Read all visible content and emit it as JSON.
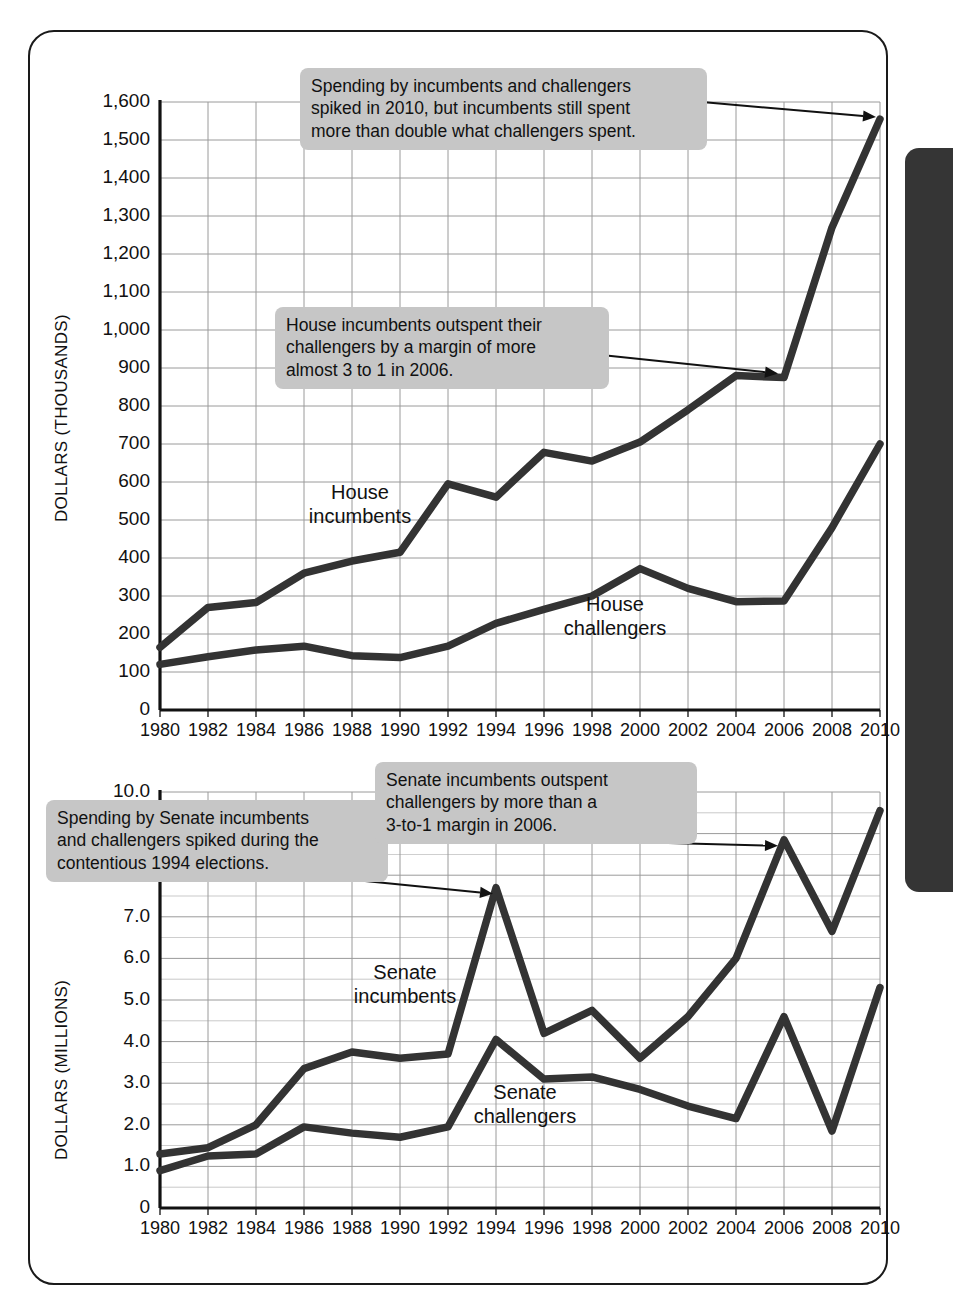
{
  "page": {
    "side_tab_color": "#353535",
    "card_border_color": "#1a1a1a",
    "callout_bg": "#c6c6c6",
    "line_color": "#333333",
    "grid_color": "#9a9a9a"
  },
  "chart_data": [
    {
      "id": "house",
      "type": "line",
      "title": "",
      "xlabel": "",
      "ylabel": "DOLLARS (THOUSANDS)",
      "x": [
        1980,
        1982,
        1984,
        1986,
        1988,
        1990,
        1992,
        1994,
        1996,
        1998,
        2000,
        2002,
        2004,
        2006,
        2008,
        2010
      ],
      "xtick_labels": [
        "1980",
        "1982",
        "1984",
        "1986",
        "1988",
        "1990",
        "1992",
        "1994",
        "1996",
        "1998",
        "2000",
        "2002",
        "2004",
        "2006",
        "2008",
        "2010"
      ],
      "ytick_labels": [
        "0",
        "100",
        "200",
        "300",
        "400",
        "500",
        "600",
        "700",
        "800",
        "900",
        "1,000",
        "1,100",
        "1,200",
        "1,300",
        "1,400",
        "1,500",
        "1,600"
      ],
      "ylim": [
        0,
        1600
      ],
      "xlim": [
        1980,
        2010
      ],
      "grid": true,
      "legend": "inline-labels",
      "series": [
        {
          "name": "House\nincumbents",
          "label_text": "House\nincumbents",
          "values": [
            165,
            270,
            283,
            360,
            392,
            415,
            595,
            560,
            678,
            655,
            705,
            790,
            880,
            875,
            1270,
            1555
          ]
        },
        {
          "name": "House\nchallengers",
          "label_text": "House\nchallengers",
          "values": [
            120,
            140,
            158,
            168,
            143,
            138,
            168,
            228,
            265,
            300,
            372,
            320,
            285,
            287,
            480,
            700
          ]
        }
      ],
      "annotations": [
        {
          "text": "Spending by incumbents and challengers\nspiked in 2010, but incumbents still spent\nmore than double what challengers spent.",
          "points_to_year": 2010,
          "points_to_series": "House incumbents"
        },
        {
          "text": "House incumbents outspent their\nchallengers by a margin of more\nalmost 3 to 1 in 2006.",
          "points_to_year": 2006,
          "points_to_series": "House incumbents"
        }
      ]
    },
    {
      "id": "senate",
      "type": "line",
      "title": "",
      "xlabel": "",
      "ylabel": "DOLLARS (MILLIONS)",
      "x": [
        1980,
        1982,
        1984,
        1986,
        1988,
        1990,
        1992,
        1994,
        1996,
        1998,
        2000,
        2002,
        2004,
        2006,
        2008,
        2010
      ],
      "xtick_labels": [
        "1980",
        "1982",
        "1984",
        "1986",
        "1988",
        "1990",
        "1992",
        "1994",
        "1996",
        "1998",
        "2000",
        "2002",
        "2004",
        "2006",
        "2008",
        "2010"
      ],
      "ytick_labels": [
        "0",
        "1.0",
        "2.0",
        "3.0",
        "4.0",
        "5.0",
        "6.0",
        "7.0",
        "8.0",
        "9.0",
        "10.0"
      ],
      "ylim": [
        0,
        10
      ],
      "xlim": [
        1980,
        2010
      ],
      "grid": true,
      "minor_gridline_step": 0.5,
      "legend": "inline-labels",
      "series": [
        {
          "name": "Senate\nincumbents",
          "label_text": "Senate\nincumbents",
          "values": [
            1.3,
            1.45,
            2.0,
            3.35,
            3.75,
            3.6,
            3.7,
            7.7,
            4.2,
            4.75,
            3.6,
            4.6,
            6.0,
            8.85,
            6.65,
            9.55
          ]
        },
        {
          "name": "Senate\nchallengers",
          "label_text": "Senate\nchallengers",
          "values": [
            0.9,
            1.25,
            1.3,
            1.95,
            1.8,
            1.7,
            1.95,
            4.05,
            3.1,
            3.15,
            2.85,
            2.45,
            2.15,
            4.6,
            1.85,
            5.3
          ]
        }
      ],
      "annotations": [
        {
          "text": "Spending by Senate incumbents\nand challengers spiked during the\ncontentious 1994 elections.",
          "points_to_year": 1994,
          "points_to_series": "Senate incumbents"
        },
        {
          "text": "Senate incumbents outspent\nchallengers by more than a\n3-to-1 margin in 2006.",
          "points_to_year": 2006,
          "points_to_series": "Senate incumbents"
        }
      ]
    }
  ]
}
